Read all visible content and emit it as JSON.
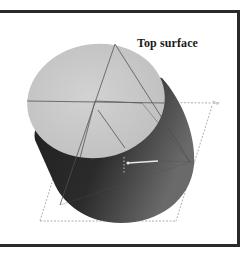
{
  "figure": {
    "title": "Top surface",
    "axis_label": "Top",
    "marker_label": "surface",
    "colors": {
      "frame": "#2a2a2a",
      "top_face": "#c9c9c9",
      "side_dark": "#2e2e2e",
      "side_mid": "#5a5a5a",
      "construction_line": "#555555",
      "dashed_line": "#999999"
    }
  }
}
